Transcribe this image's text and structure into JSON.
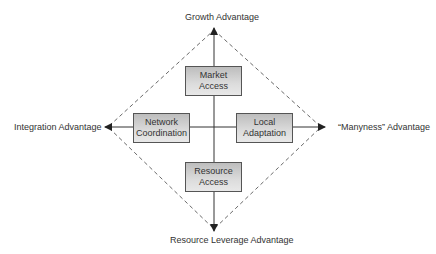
{
  "axes": {
    "top": "Growth Advantage",
    "bottom": "Resource  Leverage Advantage",
    "left": "Integration Advantage",
    "right": "“Manyness” Advantage"
  },
  "boxes": {
    "market": {
      "line1": "Market",
      "line2": "Access"
    },
    "network": {
      "line1": "Network",
      "line2": "Coordination"
    },
    "local": {
      "line1": "Local",
      "line2": "Adaptation"
    },
    "resource": {
      "line1": "Resource",
      "line2": "Access"
    }
  },
  "colors": {
    "line": "#333333",
    "box_border": "#555555",
    "box_fill": "#d0d0d0"
  }
}
